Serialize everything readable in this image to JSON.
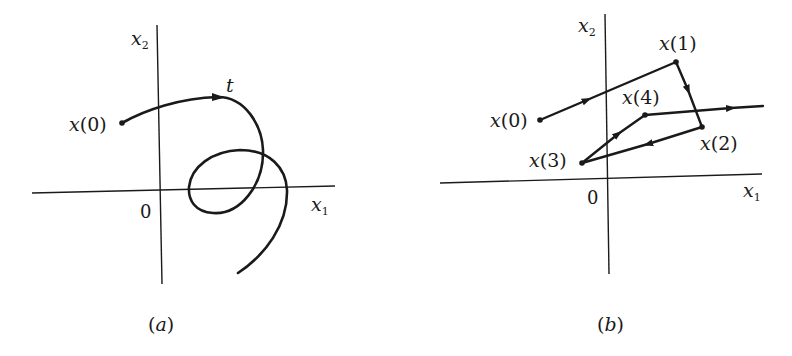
{
  "panels": [
    {
      "id": "a",
      "caption": "(a)",
      "caption_letter": "a",
      "x_axis_label": "x",
      "x_axis_sub": "1",
      "y_axis_label": "x",
      "y_axis_sub": "2",
      "origin_label": "0",
      "start_label": "x(0)",
      "start_label_parts": {
        "var": "x",
        "arg": "(0)"
      },
      "direction_label": "t",
      "description": "Continuous trajectory starting at x(0), moving in direction t, forming a loop and exiting downward"
    },
    {
      "id": "b",
      "caption": "(b)",
      "caption_letter": "b",
      "x_axis_label": "x",
      "x_axis_sub": "1",
      "y_axis_label": "x",
      "y_axis_sub": "2",
      "origin_label": "0",
      "points": [
        {
          "name": "x(0)",
          "var": "x",
          "arg": "(0)"
        },
        {
          "name": "x(1)",
          "var": "x",
          "arg": "(1)"
        },
        {
          "name": "x(2)",
          "var": "x",
          "arg": "(2)"
        },
        {
          "name": "x(3)",
          "var": "x",
          "arg": "(3)"
        },
        {
          "name": "x(4)",
          "var": "x",
          "arg": "(4)"
        }
      ],
      "description": "Discrete trajectory x(0) → x(1) → x(2) → x(3) → x(4) → continuing right"
    }
  ],
  "colors": {
    "ink": "#1a1a1a",
    "background": "#ffffff"
  }
}
